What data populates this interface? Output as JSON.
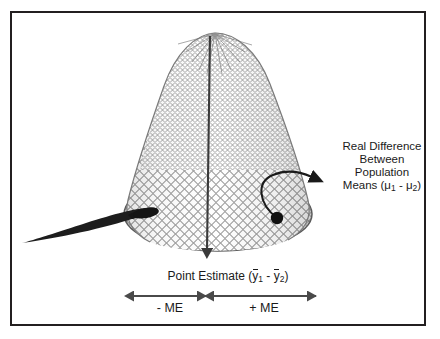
{
  "figure": {
    "name": "confidence-interval-fishing-net-diagram",
    "background_color": "#ffffff",
    "frame_color": "#231f20",
    "ink_color": "#1a1a1a",
    "mesh_color": "#8c8c8c"
  },
  "annotations": {
    "real_difference": {
      "line1": "Real Difference",
      "line2": "Between",
      "line3": "Population",
      "line4_prefix": "Means (",
      "line4_mu1": "μ",
      "line4_sub1": "1",
      "line4_mid": " - ",
      "line4_mu2": "μ",
      "line4_sub2": "2",
      "line4_suffix": ")"
    },
    "point_estimate": {
      "prefix": "Point Estimate (",
      "ybar1": "y",
      "sub1": "1",
      "mid": " - ",
      "ybar2": "y",
      "sub2": "2",
      "suffix": ")"
    },
    "margin_of_error": {
      "negative": "- ME",
      "positive": "+ ME"
    }
  },
  "graphics": {
    "net_apex": "215,33",
    "net_rim_center": "218,214",
    "net_rim_rx": "94",
    "net_rim_ry": "36",
    "handle_tip": "22,243",
    "vertical_arrow_tip": "207,262",
    "dot_center": "277,218",
    "curved_arrow_tip": "320,173",
    "me_axis_y": "296",
    "me_left_start": "132",
    "me_split": "208",
    "me_right_end": "316"
  }
}
